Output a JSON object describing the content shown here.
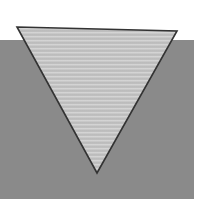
{
  "canvas": {
    "width": 210,
    "height": 199,
    "background_color": "#ffffff",
    "description": "Downward-pointing light gray triangle overlapping a medium gray rectangular panel on a white page"
  },
  "shapes": {
    "background_panel": {
      "name": "gray-background-panel",
      "kind": "rectangle",
      "x": 0,
      "y": 40,
      "width": 194,
      "height": 159,
      "fill_color": "#8a8a8a",
      "stroke_color": "none"
    },
    "triangle": {
      "name": "inverted-triangle",
      "kind": "triangle",
      "orientation": "pointing-down",
      "points": "17,27 177,31 97,173",
      "vertices": [
        {
          "label": "top-left",
          "x": 17,
          "y": 27
        },
        {
          "label": "top-right",
          "x": 177,
          "y": 31
        },
        {
          "label": "bottom-apex",
          "x": 97,
          "y": 173
        }
      ],
      "fill_color": "#c5c5c5",
      "fill_top_color": "#cfcfcf",
      "fill_bottom_color": "#bdbdbd",
      "stroke_color": "#333333",
      "stroke_width": 1.6
    }
  }
}
